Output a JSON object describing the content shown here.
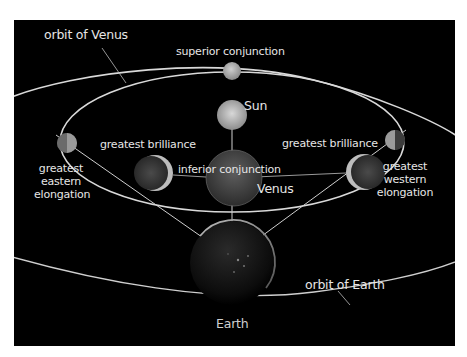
{
  "diagram": {
    "labels": {
      "orbit_venus": "orbit of Venus",
      "orbit_earth": "orbit of Earth",
      "superior_conjunction": "superior conjunction",
      "sun": "Sun",
      "greatest_brilliance_left": "greatest brilliance",
      "greatest_brilliance_right": "greatest brilliance",
      "inferior_conjunction": "inferior conjunction",
      "venus": "Venus",
      "greatest_eastern_elongation": [
        "greatest",
        "eastern",
        "elongation"
      ],
      "greatest_western_elongation": [
        "greatest",
        "western",
        "elongation"
      ],
      "earth": "Earth"
    },
    "bodies": [
      {
        "name": "venus-superior-conjunction",
        "phase": "full"
      },
      {
        "name": "sun"
      },
      {
        "name": "venus-greatest-eastern-elongation",
        "phase": "half"
      },
      {
        "name": "venus-greatest-brilliance-east",
        "phase": "crescent"
      },
      {
        "name": "venus-inferior-conjunction",
        "phase": "new"
      },
      {
        "name": "venus-greatest-brilliance-west",
        "phase": "crescent"
      },
      {
        "name": "venus-greatest-western-elongation",
        "phase": "half"
      },
      {
        "name": "earth"
      }
    ],
    "colors": {
      "background": "#000000",
      "frame": "#ffffff",
      "orbit_line": "#d9d9d9",
      "label_text": "#e6e6e6",
      "planet_lit": "#bdbdbd",
      "planet_dark": "#3a3a3a"
    }
  }
}
